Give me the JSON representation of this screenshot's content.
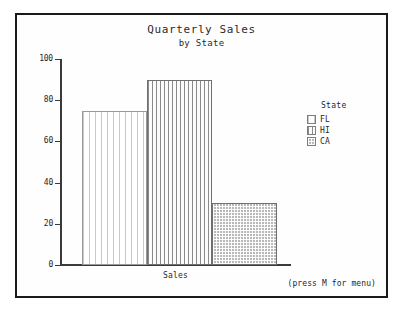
{
  "chart_data": {
    "type": "bar",
    "title": "Quarterly Sales",
    "subtitle": "by State",
    "xlabel": "Sales",
    "ylabel": "",
    "categories": [
      "Sales"
    ],
    "ylim": [
      0,
      100
    ],
    "yticks": [
      0,
      20,
      40,
      60,
      80,
      100
    ],
    "ytick_labels": [
      "0",
      "20",
      "40",
      "60",
      "80",
      "100"
    ],
    "grid": false,
    "legend_position": "right",
    "legend_title": "State",
    "series": [
      {
        "name": "FL",
        "values": [
          75
        ],
        "pattern": "sparse-vertical-lines",
        "color": "#c9c9c9"
      },
      {
        "name": "HI",
        "values": [
          90
        ],
        "pattern": "dense-vertical-stripes",
        "color": "#8a8a8a"
      },
      {
        "name": "CA",
        "values": [
          30
        ],
        "pattern": "crosshatch",
        "color": "#b9b9b9"
      }
    ]
  },
  "footer": {
    "hint": "(press M for menu)"
  }
}
